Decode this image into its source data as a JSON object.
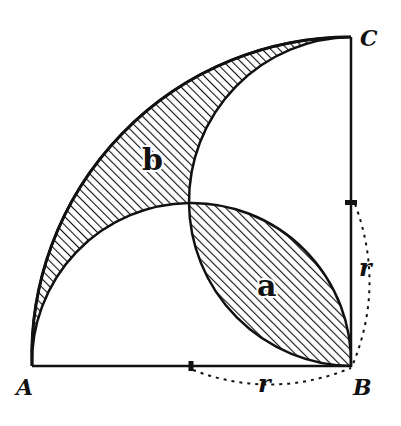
{
  "diagram": {
    "points": {
      "A": {
        "label": "A"
      },
      "B": {
        "label": "B"
      },
      "C": {
        "label": "C"
      }
    },
    "regions": {
      "a": {
        "label": "a"
      },
      "b": {
        "label": "b"
      }
    },
    "dimensions": {
      "horizontal_radius": {
        "label": "r"
      },
      "vertical_radius": {
        "label": "r"
      }
    },
    "colors": {
      "ink": "#111111",
      "background": "#ffffff"
    }
  }
}
